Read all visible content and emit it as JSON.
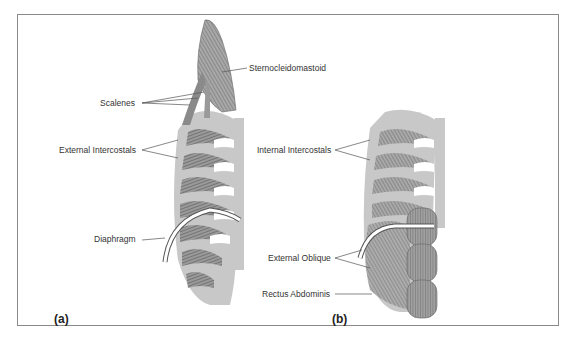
{
  "figure": {
    "panels": [
      {
        "id": "a",
        "label": "(a)",
        "callouts": [
          {
            "text": "Sternocleidomastoid"
          },
          {
            "text": "Scalenes"
          },
          {
            "text": "External Intercostals"
          },
          {
            "text": "Diaphragm"
          }
        ]
      },
      {
        "id": "b",
        "label": "(b)",
        "callouts": [
          {
            "text": "Internal Intercostals"
          },
          {
            "text": "External Oblique"
          },
          {
            "text": "Rectus Abdominis"
          }
        ]
      }
    ],
    "colors": {
      "bone": "#c8c8c8",
      "muscle_dark": "#6e6e6e",
      "muscle_mid": "#9a9a9a",
      "frame": "#8a8a8a",
      "text": "#333333"
    }
  }
}
